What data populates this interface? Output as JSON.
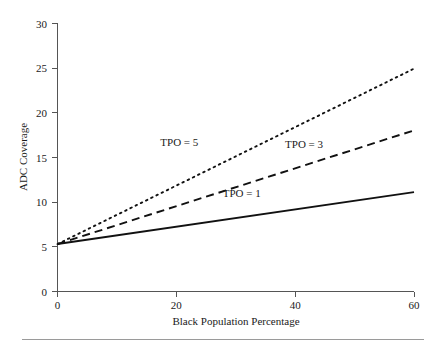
{
  "chart_data": {
    "type": "line",
    "title": "",
    "xlabel": "Black Population Percentage",
    "ylabel": "ADC Coverage",
    "xlim": [
      0,
      60
    ],
    "ylim": [
      0,
      30
    ],
    "xticks": [
      0,
      20,
      40,
      60
    ],
    "yticks": [
      0,
      5,
      10,
      15,
      20,
      25,
      30
    ],
    "xtick_labels": [
      "0",
      "20",
      "40",
      "60"
    ],
    "ytick_labels": [
      "0",
      "5",
      "10",
      "15",
      "20",
      "25",
      "30"
    ],
    "grid": false,
    "legend_position": "inline-annotations",
    "x": [
      0,
      60
    ],
    "series": [
      {
        "name": "TPO = 1",
        "style": "solid",
        "color": "#111111",
        "values": [
          5.3,
          11.1
        ],
        "label": "TPO = 1",
        "label_x": 31,
        "label_y": 10.6
      },
      {
        "name": "TPO = 3",
        "style": "dashed",
        "color": "#111111",
        "values": [
          5.3,
          18.0
        ],
        "label": "TPO = 3",
        "label_x": 41.5,
        "label_y": 16.0
      },
      {
        "name": "TPO = 5",
        "style": "dotted",
        "color": "#111111",
        "values": [
          5.3,
          24.9
        ],
        "label": "TPO = 5",
        "label_x": 20.5,
        "label_y": 16.3
      }
    ],
    "annotations": [
      {
        "text": "TPO = 5"
      },
      {
        "text": "TPO = 3"
      },
      {
        "text": "TPO = 1"
      }
    ]
  },
  "figure": {
    "background_color": "#ffffff",
    "axis_color": "#555555",
    "line_color": "#111111",
    "footer_rule_color": "#9a9a9a"
  }
}
